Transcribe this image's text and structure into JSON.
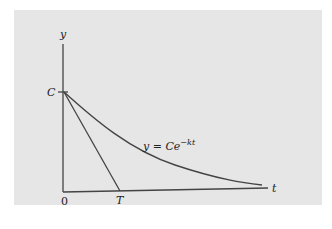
{
  "figure": {
    "background_color": "#e6e6e6",
    "line_color": "#444444",
    "y_axis_label": "y",
    "x_axis_label": "t",
    "origin_label": "0",
    "y_intercept_label": "C",
    "tangent_intercept_label": "T",
    "curve_label_prefix": "y = Ce",
    "curve_label_exponent": "−kt"
  }
}
